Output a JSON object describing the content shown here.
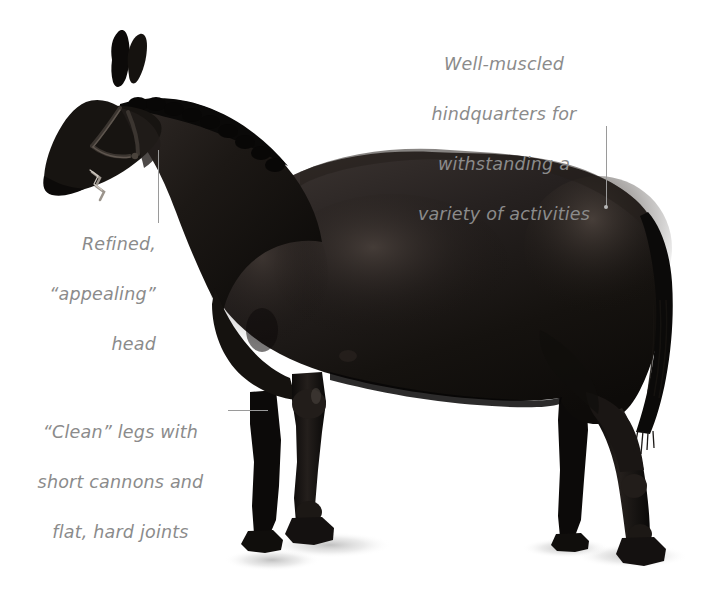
{
  "figure": {
    "background_color": "#ffffff",
    "coat_color": "#1a1715",
    "annotation_text_color": "#8b8b8b",
    "leader_line_color": "#9a9a9a",
    "ground_shadow_color": "#d8d8d8"
  },
  "annotations": [
    {
      "id": "hindquarters",
      "lines": [
        "Well-muscled",
        "hindquarters for",
        "withstanding a",
        "variety of activities"
      ],
      "full_text": "Well-muscled hindquarters for withstanding a variety of activities",
      "align": "center",
      "leader": {
        "orientation": "vertical",
        "x": 607,
        "y1": 126,
        "y2": 208,
        "endpoint_marker": "dot"
      },
      "points_to": "hindquarters"
    },
    {
      "id": "head",
      "lines": [
        "Refined,",
        "“appealing”",
        "head"
      ],
      "full_text": "Refined, “appealing” head",
      "align": "right",
      "leader": {
        "orientation": "vertical",
        "x": 159,
        "y1": 150,
        "y2": 223,
        "endpoint_marker": "none"
      },
      "points_to": "throatlatch-head"
    },
    {
      "id": "legs",
      "lines": [
        "“Clean” legs with",
        "short cannons and",
        "flat, hard joints"
      ],
      "full_text": "“Clean” legs with short cannons and flat, hard joints",
      "align": "center",
      "leader": {
        "orientation": "horizontal",
        "y": 410,
        "x1": 228,
        "x2": 268,
        "endpoint_marker": "none"
      },
      "points_to": "front-foreleg"
    }
  ]
}
